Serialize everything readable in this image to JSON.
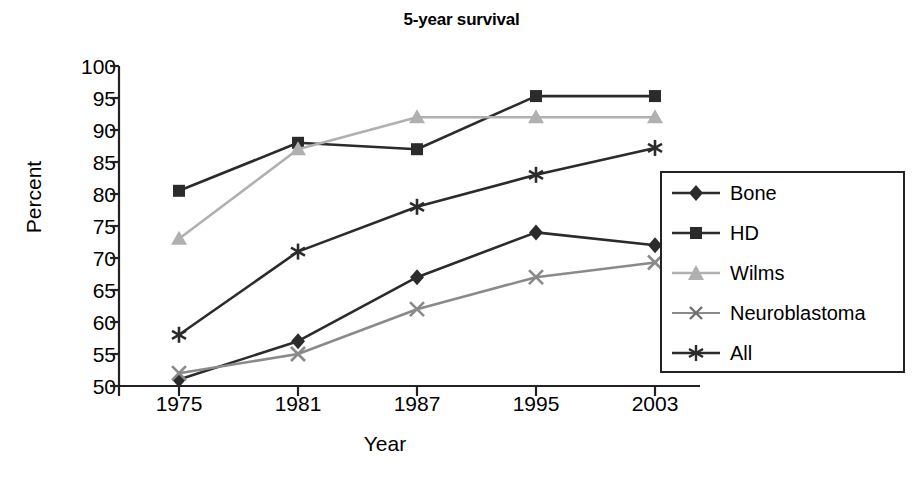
{
  "chart_data": {
    "type": "line",
    "title": "5-year survival",
    "xlabel": "Year",
    "ylabel": "Percent",
    "categories": [
      "1975",
      "1981",
      "1987",
      "1995",
      "2003"
    ],
    "ylim": [
      50,
      100
    ],
    "yticks": [
      "50",
      "55",
      "60",
      "65",
      "70",
      "75",
      "80",
      "85",
      "90",
      "95",
      "100"
    ],
    "grid": false,
    "legend_position": "right-inside",
    "series": [
      {
        "name": "Bone",
        "marker": "diamond",
        "color": "#2b2b2b",
        "values": [
          51,
          57,
          67,
          74,
          72
        ]
      },
      {
        "name": "HD",
        "marker": "square",
        "color": "#2b2b2b",
        "values": [
          80.5,
          88,
          87,
          95.3,
          95.3
        ]
      },
      {
        "name": "Wilms",
        "marker": "triangle",
        "color": "#b0b0b0",
        "values": [
          73,
          87,
          92,
          92,
          92
        ]
      },
      {
        "name": "Neuroblastoma",
        "marker": "cross",
        "color": "#8a8a8a",
        "values": [
          52,
          55,
          62,
          67,
          69.3
        ]
      },
      {
        "name": "All",
        "marker": "star",
        "color": "#2b2b2b",
        "values": [
          58,
          71,
          78,
          83,
          87.2
        ]
      }
    ]
  },
  "axis": {
    "y_label": "Percent",
    "x_label": "Year",
    "y_tick_0": "50",
    "y_tick_1": "55",
    "y_tick_2": "60",
    "y_tick_3": "65",
    "y_tick_4": "70",
    "y_tick_5": "75",
    "y_tick_6": "80",
    "y_tick_7": "85",
    "y_tick_8": "90",
    "y_tick_9": "95",
    "y_tick_10": "100",
    "x_tick_0": "1975",
    "x_tick_1": "1981",
    "x_tick_2": "1987",
    "x_tick_3": "1995",
    "x_tick_4": "2003"
  },
  "legend": {
    "items": [
      {
        "label": "Bone"
      },
      {
        "label": "HD"
      },
      {
        "label": "Wilms"
      },
      {
        "label": "Neuroblastoma"
      },
      {
        "label": "All"
      }
    ]
  }
}
